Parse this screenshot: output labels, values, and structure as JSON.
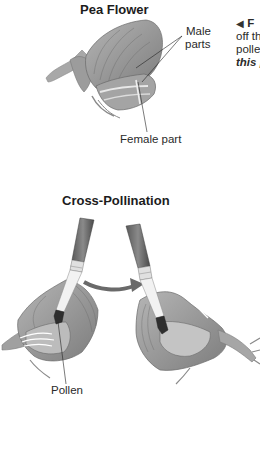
{
  "pea_flower": {
    "title": "Pea Flower",
    "labels": {
      "male_line1": "Male",
      "male_line2": "parts",
      "female": "Female part"
    }
  },
  "side_caption": {
    "marker": "◀",
    "line1_bold": "F",
    "line2": "off th",
    "line3": "polle",
    "line4_italic": "this p"
  },
  "cross_pollination": {
    "title": "Cross-Pollination",
    "labels": {
      "pollen": "Pollen"
    }
  },
  "colors": {
    "petal": "#9a9a9a",
    "petal_dark": "#6e6e6e",
    "petal_light": "#c8c8c8",
    "text": "#1c1c1c",
    "arrow": "#6a6a6a"
  }
}
